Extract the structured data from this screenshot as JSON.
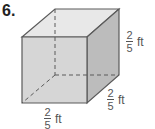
{
  "problem": {
    "number": "6.",
    "shape": "cube",
    "labels": {
      "height": {
        "numerator": "2",
        "denominator": "5",
        "unit": "ft"
      },
      "depth": {
        "numerator": "2",
        "denominator": "5",
        "unit": "ft"
      },
      "width": {
        "numerator": "2",
        "denominator": "5",
        "unit": "ft"
      }
    },
    "colors": {
      "front_face": "#d6d6d6",
      "top_face": "#e8e8e8",
      "side_face": "#bcbcbc",
      "edge": "#5a5a5a"
    }
  }
}
